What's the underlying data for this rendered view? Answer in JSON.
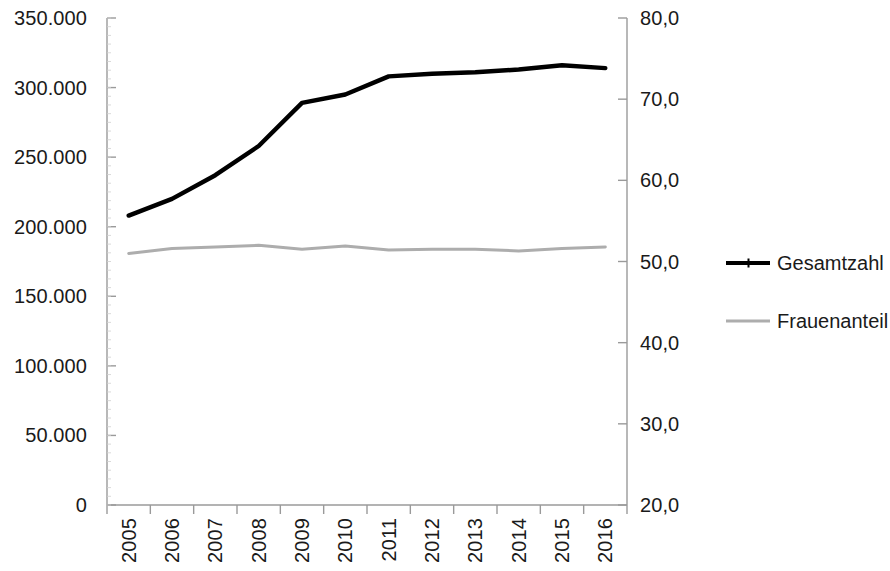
{
  "chart_data": {
    "type": "line",
    "title": "",
    "subtitle": "",
    "xlabel": "",
    "ylabel": "",
    "grid": false,
    "legend_position": "right",
    "categories": [
      "2005",
      "2006",
      "2007",
      "2008",
      "2009",
      "2010",
      "2011",
      "2012",
      "2013",
      "2014",
      "2015",
      "2016"
    ],
    "axes": {
      "x": {
        "tick_labels": [
          "2005",
          "2006",
          "2007",
          "2008",
          "2009",
          "2010",
          "2011",
          "2012",
          "2013",
          "2014",
          "2015",
          "2016"
        ],
        "label_rotation_deg": 90
      },
      "y_left": {
        "ylim": [
          0,
          350000
        ],
        "tick_values": [
          0,
          50000,
          100000,
          150000,
          200000,
          250000,
          300000,
          350000
        ],
        "tick_labels": [
          "0",
          "50.000",
          "100.000",
          "150.000",
          "200.000",
          "250.000",
          "300.000",
          "350.000"
        ],
        "series_ref": "Gesamtzahl"
      },
      "y_right": {
        "ylim": [
          20,
          80
        ],
        "tick_values": [
          20,
          30,
          40,
          50,
          60,
          70,
          80
        ],
        "tick_labels": [
          "20,0",
          "30,0",
          "40,0",
          "50,0",
          "60,0",
          "70,0",
          "80,0"
        ],
        "series_ref": "Frauenanteil"
      }
    },
    "series": [
      {
        "name": "Gesamtzahl",
        "axis": "y_left",
        "color": "#000000",
        "line_width": 4,
        "marker": "plus",
        "values": [
          208000,
          220000,
          237000,
          258000,
          289000,
          295000,
          308000,
          310000,
          311000,
          313000,
          316000,
          314000
        ]
      },
      {
        "name": "Frauenanteil",
        "axis": "y_right",
        "color": "#adadad",
        "line_width": 3,
        "marker": "none",
        "values": [
          51.0,
          51.6,
          51.8,
          52.0,
          51.5,
          51.9,
          51.4,
          51.5,
          51.5,
          51.3,
          51.6,
          51.8
        ]
      }
    ]
  },
  "legend": {
    "items": [
      {
        "label": "Gesamtzahl",
        "color": "#000000",
        "style": "solid-thick-with-plus-marker"
      },
      {
        "label": "Frauenanteil",
        "color": "#adadad",
        "style": "solid-thin"
      }
    ]
  },
  "colors": {
    "total_line": "#000000",
    "women_line": "#adadad",
    "axis": "#9a9a9a",
    "text": "#1a1a1a",
    "background": "#ffffff"
  }
}
